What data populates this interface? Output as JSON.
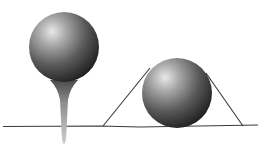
{
  "illustration": {
    "description": "Two shaded spheres: golf ball on a tee and a ball resting on ground with tangent lines",
    "colors": {
      "background": "#ffffff",
      "line": "#3a3a3a",
      "sphere_highlight": "#e6e6e6",
      "sphere_mid": "#8a8a8a",
      "sphere_shadow": "#1e1e1e",
      "tee": "#9a9a9a"
    }
  }
}
